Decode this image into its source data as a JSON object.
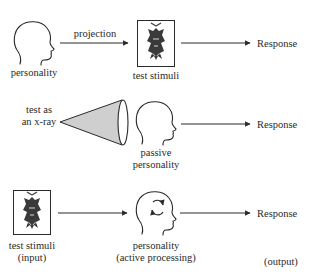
{
  "colors": {
    "ink": "#2a2a2a",
    "cone_fill": "#cfcfcf",
    "fly_fill": "#3a3a3a",
    "background": "#ffffff"
  },
  "rows": [
    {
      "id": "projective",
      "source": {
        "icon": "head-icon",
        "label": "personality"
      },
      "arrow_label": "projection",
      "middle": {
        "icon": "inkblot-fly-icon",
        "label": "test stimuli"
      },
      "output": {
        "label": "Response"
      }
    },
    {
      "id": "x-ray",
      "source": {
        "icon": "cone-icon",
        "label_line1": "test as",
        "label_line2": "an x-ray"
      },
      "middle": {
        "icon": "head-icon",
        "label_line1": "passive",
        "label_line2": "personality"
      },
      "output": {
        "label": "Response"
      }
    },
    {
      "id": "processing",
      "source": {
        "icon": "inkblot-fly-icon",
        "label_line1": "test stimuli",
        "label_line2": "(input)"
      },
      "middle": {
        "icon": "head-cycle-icon",
        "label_line1": "personality",
        "label_line2": "(active processing)"
      },
      "output": {
        "label": "Response",
        "sublabel": "(output)"
      }
    }
  ]
}
